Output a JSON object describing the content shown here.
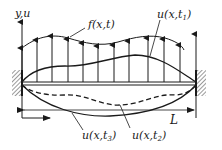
{
  "diagram": {
    "type": "clamped string/beam under distributed load",
    "axis_label": "y,u",
    "load_label": "f(x,t)",
    "curves": [
      {
        "label_main": "u(x,t",
        "sub": "1",
        "close": ")",
        "style": "solid",
        "position": "above beam"
      },
      {
        "label_main": "u(x,t",
        "sub": "2",
        "close": ")",
        "style": "dashed",
        "position": "below beam"
      },
      {
        "label_main": "u(x,t",
        "sub": "3",
        "close": ")",
        "style": "solid",
        "position": "below beam"
      }
    ],
    "length_label": "L",
    "supports": [
      "fixed-left",
      "fixed-right"
    ],
    "load_arrow_count": 11,
    "colors": {
      "ink": "#1a1a1a",
      "hatch": "#555555",
      "background": "#ffffff"
    }
  }
}
